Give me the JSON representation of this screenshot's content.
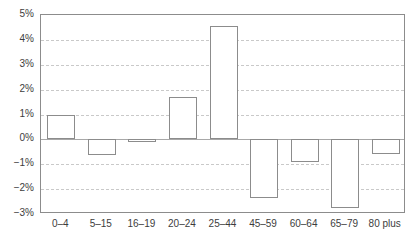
{
  "chart_data": {
    "type": "bar",
    "title": "",
    "subtitle": "",
    "xlabel": "",
    "ylabel": "",
    "categories": [
      "0–4",
      "5–15",
      "16–19",
      "20–24",
      "25–44",
      "45–59",
      "60–64",
      "65–79",
      "80 plus"
    ],
    "values": [
      1.0,
      -0.62,
      -0.12,
      1.7,
      4.55,
      -2.35,
      -0.9,
      -2.75,
      -0.6
    ],
    "value_unit": "%",
    "ylim": [
      -3,
      5
    ],
    "ytick_labels": [
      "5%",
      "4%",
      "3%",
      "2%",
      "1%",
      "0%",
      "−1%",
      "−2%",
      "−3%"
    ],
    "ytick_values": [
      5,
      4,
      3,
      2,
      1,
      0,
      -1,
      -2,
      -3
    ],
    "grid": true,
    "grid_axis": "y",
    "grid_style": "dashed",
    "legend": false,
    "legend_position": "none",
    "series": [
      {
        "name": "",
        "values": [
          1.0,
          -0.62,
          -0.12,
          1.7,
          4.55,
          -2.35,
          -0.9,
          -2.75,
          -0.6
        ]
      }
    ],
    "colors": {
      "bar_fill": "#ffffff",
      "bar_edge": "#8c8c8c",
      "grid": "#c9c9c9",
      "zero_line": "#a8a8a8",
      "axis": "#8c8c8c",
      "text": "#3d3d3d",
      "background": "#ffffff"
    }
  }
}
